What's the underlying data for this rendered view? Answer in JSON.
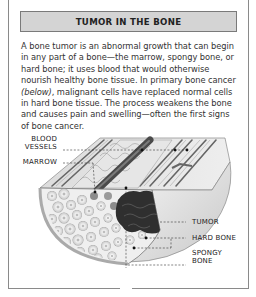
{
  "header": {
    "title": "TUMOR IN THE BONE"
  },
  "body": {
    "text_before": "A bone tumor is an abnormal growth that can begin in any part of a bone—the marrow, spongy bone, or hard bone; it uses blood that would otherwise nourish healthy bone tissue. In primary bone cancer ",
    "text_italic": "(below)",
    "text_after": ", malignant cells have replaced normal cells in hard bone tissue. The process weakens the bone and causes pain and swelling—often the first signs of bone cancer."
  },
  "illustration": {
    "labels": {
      "blood_vessels_line1": "BLOOD",
      "blood_vessels_line2": "VESSELS",
      "marrow": "MARROW",
      "tumor": "TUMOR",
      "hard_bone": "HARD BONE",
      "spongy_bone_line1": "SPONGY",
      "spongy_bone_line2": "BONE"
    },
    "colors": {
      "header_bg": "#d4d4d4",
      "tumor": "#2e2e2e",
      "vessel": "#555555",
      "bone_light": "#e8e8e8"
    }
  }
}
